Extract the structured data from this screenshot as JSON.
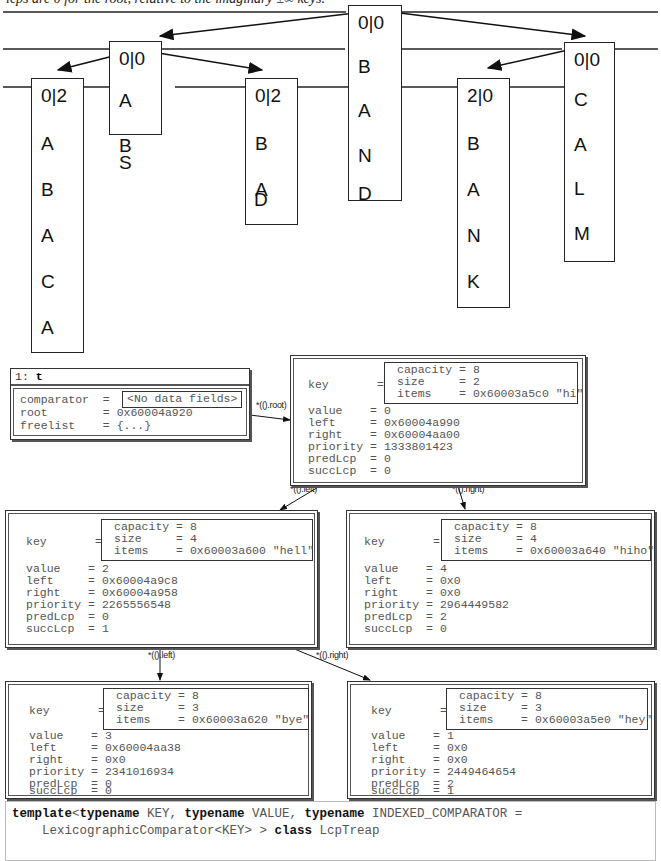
{
  "caption": "lcps are 0 for the root, relative to the imaginary ±∞ keys.",
  "tree": {
    "nodes": [
      {
        "id": "BAND",
        "lcp": "0|0",
        "letters": [
          "B",
          "A",
          "N",
          "D"
        ]
      },
      {
        "id": "ABS",
        "lcp": "0|0",
        "letters": [
          "A",
          "B",
          "S"
        ]
      },
      {
        "id": "CALM",
        "lcp": "0|0",
        "letters": [
          "C",
          "A",
          "L",
          "M"
        ]
      },
      {
        "id": "ABACA",
        "lcp": "0|2",
        "letters": [
          "A",
          "B",
          "A",
          "C",
          "A"
        ]
      },
      {
        "id": "BAD",
        "lcp": "0|2",
        "letters": [
          "B",
          "A",
          "D"
        ]
      },
      {
        "id": "BANK",
        "lcp": "2|0",
        "letters": [
          "B",
          "A",
          "N",
          "K"
        ]
      }
    ]
  },
  "debugger": {
    "t_panel": {
      "title_num": "1:",
      "title_var": "t",
      "fields": [
        {
          "name": "comparator",
          "value": "<No data fields>"
        },
        {
          "name": "root",
          "value": "0x60004a920"
        },
        {
          "name": "freelist",
          "value": "{...}"
        }
      ]
    },
    "edges": {
      "root": "*(().root)",
      "root_left": "*(().left)",
      "root_right": "*(().right)",
      "hell_left": "*(().left)",
      "hell_right": "*(().right)"
    },
    "nodes": [
      {
        "id": "hi",
        "capacity": "8",
        "size": "2",
        "items": "0x60003a5c0 \"hi\"",
        "value": "0",
        "left": "0x60004a990",
        "right": "0x60004aa00",
        "priority": "1333801423",
        "predLcp": "0",
        "succLcp": "0"
      },
      {
        "id": "hell",
        "capacity": "8",
        "size": "4",
        "items": "0x60003a600 \"hell\"",
        "value": "2",
        "left": "0x60004a9c8",
        "right": "0x60004a958",
        "priority": "2265556548",
        "predLcp": "0",
        "succLcp": "1"
      },
      {
        "id": "hiho",
        "capacity": "8",
        "size": "4",
        "items": "0x60003a640 \"hiho\"",
        "value": "4",
        "left": "0x0",
        "right": "0x0",
        "priority": "2964449582",
        "predLcp": "2",
        "succLcp": "0"
      },
      {
        "id": "bye",
        "capacity": "8",
        "size": "3",
        "items": "0x60003a620 \"bye\"",
        "value": "3",
        "left": "0x60004aa38",
        "right": "0x0",
        "priority": "2341016934",
        "predLcp": "0",
        "succLcp": "0"
      },
      {
        "id": "hey",
        "capacity": "8",
        "size": "3",
        "items": "0x60003a5e0 \"hey\"",
        "value": "1",
        "left": "0x0",
        "right": "0x0",
        "priority": "2449464654",
        "predLcp": "2",
        "succLcp": "1"
      }
    ],
    "labels": {
      "key": "key",
      "eq": "=",
      "capacity": "capacity",
      "size": "size",
      "items": "items",
      "value": "value",
      "left": "left",
      "right": "right",
      "priority": "priority",
      "predLcp": "predLcp",
      "succLcp": "succLcp"
    }
  },
  "code": {
    "kw_template": "template",
    "lt": "<",
    "kw_typename1": "typename",
    "t1": " KEY, ",
    "kw_typename2": "typename",
    "t2": " VALUE, ",
    "kw_typename3": "typename",
    "t3": " INDEXED_COMPARATOR =",
    "line2a": "    LexicographicComparator<KEY> > ",
    "kw_class": "class",
    "line2b": " LcpTreap"
  }
}
